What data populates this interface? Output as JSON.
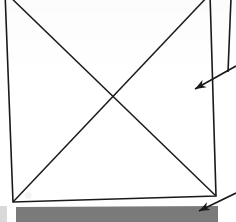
{
  "figure": {
    "background_color": "#ffffff",
    "ink_color": "#1a1a1a",
    "shaded_band_color": "#7a7a7a",
    "scan_edge_color": "#d9d9d9",
    "width": 236,
    "height": 222
  },
  "shapes": {
    "square": {
      "name": "square-outline",
      "description": "Hand/CAD drawn quadrilateral, slightly skewed by the scan, top edge cropped by the image border",
      "stroke_width": 1.6,
      "corners": {
        "top_left": {
          "x": 5,
          "y": -8
        },
        "top_right": {
          "x": 210,
          "y": -6
        },
        "bottom_right": {
          "x": 216,
          "y": 196
        },
        "bottom_left": {
          "x": 13,
          "y": 202
        }
      },
      "points": "5,-8 210,-6 216,196 13,202"
    },
    "diagonal_a": {
      "name": "diagonal-top-left-to-bottom-right",
      "x1": 5,
      "y1": -8,
      "x2": 216,
      "y2": 196,
      "stroke_width": 1.5
    },
    "diagonal_b": {
      "name": "diagonal-top-right-to-bottom-left",
      "x1": 210,
      "y1": -6,
      "x2": 13,
      "y2": 202,
      "stroke_width": 1.5
    },
    "diagonal_intersection": {
      "x": 113,
      "y": 95
    },
    "vertical_rule": {
      "name": "right-margin-vertical-line",
      "description": "Near-vertical rule at the right margin, running from the top edge down to the first leader line",
      "x1": 231,
      "y1": -2,
      "x2": 228,
      "y2": 72,
      "stroke_width": 1.6
    },
    "shaded_band": {
      "name": "shaded-band",
      "description": "Solid gray horizontal band below the square representing a hatched / filled section",
      "points": "16,207 218,206 218,222 16,222",
      "fill": "#7a7a7a"
    }
  },
  "annotations": [
    {
      "name": "leader-arrow-upper",
      "description": "Leader line entering from the right image edge, arrowhead pointing left into the square interior",
      "tail": {
        "x": 236,
        "y": 66
      },
      "tip": {
        "x": 195,
        "y": 89
      },
      "stroke_width": 1.6,
      "arrowhead_length": 11,
      "arrowhead_width": 7
    },
    {
      "name": "leader-arrow-lower",
      "description": "Leader line entering from the right image edge, arrowhead pointing left onto the shaded band",
      "tail": {
        "x": 236,
        "y": 193
      },
      "tip": {
        "x": 199,
        "y": 211
      },
      "stroke_width": 1.6,
      "arrowhead_length": 11,
      "arrowhead_width": 7
    }
  ],
  "scan_artifacts": {
    "left_bottom_edge_strip": {
      "name": "scan-edge-strip",
      "description": "Light gray sliver of the page edge visible at the bottom-left corner",
      "color": "#d9d9d9"
    }
  }
}
